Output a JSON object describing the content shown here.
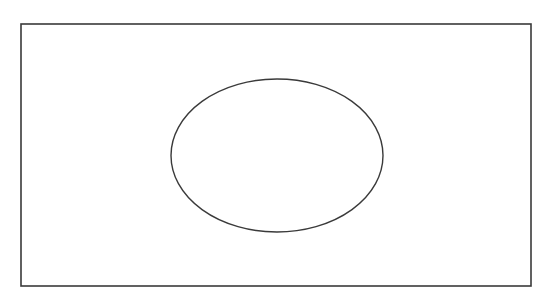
{
  "diagram": {
    "type": "venn",
    "background": "#ffffff",
    "stroke_color": "#3a3a3a",
    "universal_set": {
      "shape": "rectangle",
      "x": 21,
      "y": 24,
      "width": 510,
      "height": 262
    },
    "sets": [
      {
        "shape": "ellipse",
        "cx": 277,
        "cy": 155.5,
        "rx": 106,
        "ry": 76.5
      }
    ],
    "labels": []
  }
}
